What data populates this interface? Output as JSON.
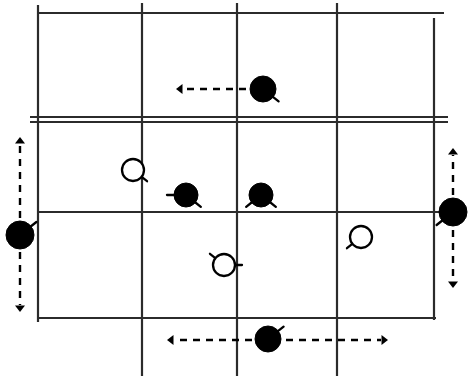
{
  "figure": {
    "width": 473,
    "height": 380,
    "background_color": "#ffffff",
    "stroke_color": "#1a1a1a",
    "fill_color": "#000000"
  },
  "grid": {
    "description": "Rectangular field divided into 3 columns by 2 interior vertical lines and into 3 rows by 2 interior horizontal lines; the upper interior horizontal line is drawn doubled",
    "line_color": "#2b2b2b",
    "line_width": 2.2,
    "columns": 4,
    "rows": 3,
    "vertical_lines": [
      {
        "name": "left-border-line",
        "x": 38,
        "y1": 5,
        "y2": 322,
        "overhang": true
      },
      {
        "name": "interior-line-1",
        "x": 142,
        "y1": 3,
        "y2": 376,
        "overhang": true
      },
      {
        "name": "interior-line-2",
        "x": 237,
        "y1": 3,
        "y2": 376,
        "overhang": true
      },
      {
        "name": "interior-line-3",
        "x": 337,
        "y1": 3,
        "y2": 376,
        "overhang": true
      },
      {
        "name": "right-border-line",
        "x": 434,
        "y1": 18,
        "y2": 320,
        "overhang": true
      }
    ],
    "horizontal_lines": [
      {
        "name": "top-border-line",
        "y": 13,
        "x1": 38,
        "x2": 444,
        "doubled": false
      },
      {
        "name": "divider-line-upper",
        "y": 117,
        "x1": 30,
        "x2": 448,
        "doubled": true,
        "second_y": 122
      },
      {
        "name": "divider-line-lower",
        "y": 212,
        "x1": 38,
        "x2": 442,
        "doubled": false
      },
      {
        "name": "bottom-border-line",
        "y": 318,
        "x1": 38,
        "x2": 436,
        "doubled": false
      }
    ]
  },
  "tokens": [
    {
      "id": "token-top-filled",
      "label": "Filled token, top row",
      "style": "filled",
      "x": 263,
      "y": 89,
      "radius": 13,
      "tails": [
        "lower-right"
      ]
    },
    {
      "id": "token-open-upper-left",
      "label": "Open token, middle band left",
      "style": "open",
      "x": 133,
      "y": 170,
      "radius": 11,
      "tails": [
        "lower-right"
      ]
    },
    {
      "id": "token-filled-center-left",
      "label": "Filled token, middle band center-left",
      "style": "filled",
      "x": 186,
      "y": 195,
      "radius": 12,
      "tails": [
        "left",
        "lower-right"
      ]
    },
    {
      "id": "token-filled-center-right",
      "label": "Filled token, middle band center-right",
      "style": "filled",
      "x": 261,
      "y": 195,
      "radius": 12,
      "tails": [
        "lower-left",
        "lower-right"
      ]
    },
    {
      "id": "token-open-center-low",
      "label": "Open token, lower band center",
      "style": "open",
      "x": 224,
      "y": 265,
      "radius": 11,
      "tails": [
        "upper-left",
        "right"
      ]
    },
    {
      "id": "token-open-right",
      "label": "Open token, lower band right",
      "style": "open",
      "x": 361,
      "y": 237,
      "radius": 11,
      "tails": [
        "lower-left"
      ]
    },
    {
      "id": "token-left-edge",
      "label": "Filled token on left margin",
      "style": "filled",
      "x": 20,
      "y": 235,
      "radius": 14,
      "tails": [
        "upper-right"
      ]
    },
    {
      "id": "token-right-edge",
      "label": "Filled token on right margin",
      "style": "filled",
      "x": 453,
      "y": 212,
      "radius": 14,
      "tails": [
        "lower-left"
      ]
    },
    {
      "id": "token-bottom",
      "label": "Filled token on bottom margin",
      "style": "filled",
      "x": 268,
      "y": 339,
      "radius": 13,
      "tails": [
        "upper-right"
      ]
    }
  ],
  "arrows": [
    {
      "id": "arrow-top-left",
      "label": "Dashed arrow pointing left from top token",
      "orientation": "horizontal",
      "direction": "left",
      "x1": 246,
      "y1": 89,
      "x2": 176,
      "y2": 89,
      "dashed": true,
      "head_at": "end"
    },
    {
      "id": "arrow-left-margin-up",
      "label": "Dashed arrow pointing up from left margin token",
      "orientation": "vertical",
      "direction": "up",
      "x1": 20,
      "y1": 218,
      "x2": 20,
      "y2": 137,
      "dashed": true,
      "head_at": "end"
    },
    {
      "id": "arrow-left-margin-down",
      "label": "Dashed arrow pointing down from left margin token",
      "orientation": "vertical",
      "direction": "down",
      "x1": 20,
      "y1": 252,
      "x2": 20,
      "y2": 312,
      "dashed": true,
      "head_at": "end"
    },
    {
      "id": "arrow-right-margin-up",
      "label": "Dashed arrow pointing up from right margin token",
      "orientation": "vertical",
      "direction": "up",
      "x1": 453,
      "y1": 195,
      "x2": 453,
      "y2": 148,
      "dashed": true,
      "head_at": "end"
    },
    {
      "id": "arrow-right-margin-down",
      "label": "Dashed arrow pointing down from right margin token",
      "orientation": "vertical",
      "direction": "down",
      "x1": 453,
      "y1": 230,
      "x2": 453,
      "y2": 288,
      "dashed": true,
      "head_at": "end"
    },
    {
      "id": "arrow-bottom-left",
      "label": "Dashed arrow pointing left from bottom token",
      "orientation": "horizontal",
      "direction": "left",
      "x1": 252,
      "y1": 340,
      "x2": 167,
      "y2": 340,
      "dashed": true,
      "head_at": "end"
    },
    {
      "id": "arrow-bottom-right",
      "label": "Dashed arrow pointing right from bottom token",
      "orientation": "horizontal",
      "direction": "right",
      "x1": 286,
      "y1": 340,
      "x2": 388,
      "y2": 340,
      "dashed": true,
      "head_at": "end"
    }
  ]
}
